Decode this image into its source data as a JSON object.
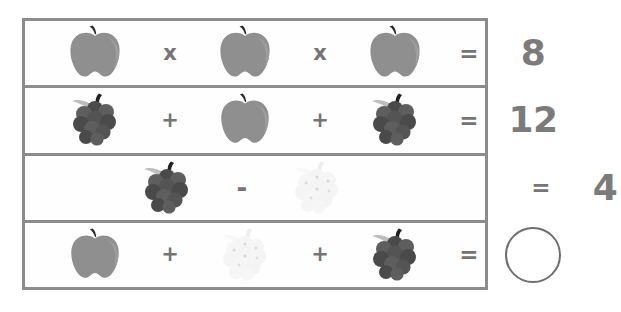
{
  "puzzle": {
    "type": "fruit-algebra-puzzle",
    "background_color": "#ffffff",
    "border_color": "#8c8c8c",
    "text_color": "#7b7b7b",
    "fruit_colors": {
      "apple_body": "#8f8f8f",
      "apple_highlight": "#9d9d9d",
      "apple_stem": "#2b2b2b",
      "grapes_body": "#5e5e5e",
      "grapes_dark": "#4a4a4a",
      "grapes_leaf": "#bdbdbd",
      "grapes_stem": "#1f1f1f",
      "faint_grapes_body": "#f4f4f4",
      "faint_grapes_dot": "#d8d8d8"
    },
    "rows": [
      {
        "id": "row-1",
        "operands": [
          {
            "icon": "apple-icon",
            "label": "apple"
          },
          {
            "icon": "apple-icon",
            "label": "apple"
          },
          {
            "icon": "apple-icon",
            "label": "apple"
          }
        ],
        "operators": [
          "x",
          "x"
        ],
        "equals": "=",
        "result": "8",
        "result_type": "number"
      },
      {
        "id": "row-2",
        "operands": [
          {
            "icon": "grapes-icon",
            "label": "grapes"
          },
          {
            "icon": "apple-icon",
            "label": "apple"
          },
          {
            "icon": "grapes-icon",
            "label": "grapes"
          }
        ],
        "operators": [
          "+",
          "+"
        ],
        "equals": "=",
        "result": "12",
        "result_type": "number"
      },
      {
        "id": "row-3",
        "operands": [
          {
            "icon": "grapes-icon",
            "label": "grapes"
          },
          {
            "icon": "faint-grapes-icon",
            "label": "faint grapes"
          }
        ],
        "operators": [
          "-"
        ],
        "equals": "=",
        "result": "4",
        "result_type": "number"
      },
      {
        "id": "row-4",
        "operands": [
          {
            "icon": "apple-icon",
            "label": "apple"
          },
          {
            "icon": "faint-grapes-icon",
            "label": "faint grapes"
          },
          {
            "icon": "grapes-icon",
            "label": "grapes"
          }
        ],
        "operators": [
          "+",
          "+"
        ],
        "equals": "=",
        "result": "",
        "result_type": "empty-circle"
      }
    ]
  }
}
